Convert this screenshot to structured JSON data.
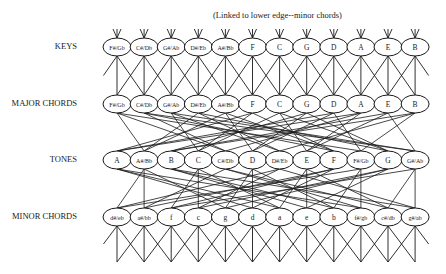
{
  "caption": "(Linked to lower edge--minor chords)",
  "colors": {
    "line": "#1a1a1a",
    "background": "#ffffff"
  },
  "layout": {
    "x0": 117,
    "dx": 27.1,
    "rx": 14,
    "ry": 9
  },
  "rows": [
    {
      "id": "keys",
      "label": "KEYS",
      "y": 47,
      "label_y": 41,
      "nodes": [
        "F#/Gb",
        "C#/Db",
        "G#/Ab",
        "D#/Eb",
        "A#/Bb",
        "F",
        "C",
        "G",
        "D",
        "A",
        "E",
        "B"
      ],
      "pitch": [
        6,
        1,
        8,
        3,
        10,
        5,
        0,
        7,
        2,
        9,
        4,
        11
      ]
    },
    {
      "id": "major",
      "label": "MAJOR CHORDS",
      "y": 104,
      "label_y": 98,
      "nodes": [
        "F#/Gb",
        "C#/Db",
        "G#/Ab",
        "D#/Eb",
        "A#/Bb",
        "F",
        "C",
        "G",
        "D",
        "A",
        "E",
        "B"
      ],
      "pitch": [
        6,
        1,
        8,
        3,
        10,
        5,
        0,
        7,
        2,
        9,
        4,
        11
      ]
    },
    {
      "id": "tones",
      "label": "TONES",
      "y": 160,
      "label_y": 154,
      "nodes": [
        "A",
        "A#/Bb",
        "B",
        "C",
        "C#/Db",
        "D",
        "D#/Eb",
        "E",
        "F",
        "F#/Gb",
        "G",
        "G#/Ab"
      ],
      "pitch": [
        9,
        10,
        11,
        0,
        1,
        2,
        3,
        4,
        5,
        6,
        7,
        8
      ]
    },
    {
      "id": "minor",
      "label": "MINOR CHORDS",
      "y": 217,
      "label_y": 211,
      "nodes": [
        "d#/eb",
        "a#/bb",
        "f",
        "c",
        "g",
        "d",
        "a",
        "e",
        "b",
        "f#/gb",
        "c#/db",
        "g#/ab"
      ],
      "pitch": [
        3,
        10,
        5,
        0,
        7,
        2,
        9,
        4,
        11,
        6,
        1,
        8
      ]
    }
  ],
  "edges": {
    "keys_to_major": "neighbors",
    "major_to_tones": "major-triad",
    "tones_to_minor": "minor-triad",
    "top_stub_length": 9,
    "bottom_fan_to_y": 262
  }
}
